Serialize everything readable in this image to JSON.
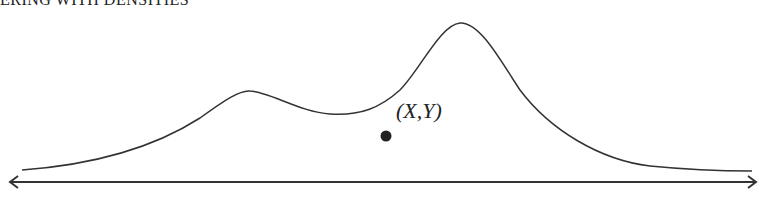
{
  "heading": "ERING WITH DENSITIES",
  "point_label": "(X,Y)",
  "colors": {
    "stroke": "#333333",
    "point": "#222222",
    "background": "#ffffff"
  },
  "diagram": {
    "curve": "bimodal density curve with smaller left peak and taller right peak",
    "point": "sample point (X,Y) located below the curve",
    "axis": "double-headed horizontal arrow"
  }
}
